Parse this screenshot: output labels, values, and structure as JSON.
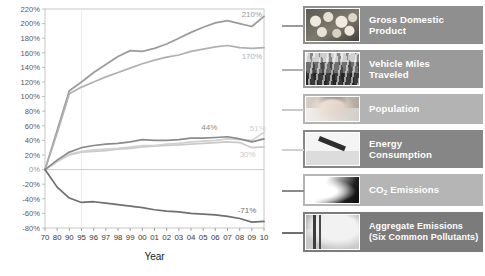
{
  "chart_data": {
    "type": "line",
    "title": "",
    "xlabel": "Year",
    "ylabel": "",
    "grid": false,
    "legend_position": "right",
    "ylim": [
      -80,
      220
    ],
    "ytick_step": 20,
    "ytick_labels": [
      "220%",
      "200%",
      "180%",
      "160%",
      "140%",
      "120%",
      "100%",
      "80%",
      "60%",
      "40%",
      "20%",
      "0%",
      "-20%",
      "-40%",
      "-60%",
      "-80%"
    ],
    "categories": [
      "70",
      "80",
      "90",
      "95",
      "96",
      "97",
      "98",
      "99",
      "00",
      "01",
      "02",
      "03",
      "04",
      "05",
      "06",
      "07",
      "08",
      "09",
      "10"
    ],
    "series": [
      {
        "name": "Gross Domestic Product",
        "color": "#9b9b9b",
        "end_label": "210%",
        "values": [
          0,
          54,
          108,
          120,
          133,
          144,
          155,
          163,
          162,
          166,
          172,
          180,
          188,
          195,
          201,
          204,
          200,
          196,
          210
        ]
      },
      {
        "name": "Vehicle Miles Traveled",
        "color": "#b0b0b0",
        "end_label": "170%",
        "values": [
          0,
          50,
          104,
          113,
          120,
          127,
          133,
          139,
          145,
          150,
          154,
          157,
          162,
          165,
          168,
          170,
          167,
          166,
          167
        ]
      },
      {
        "name": "Population",
        "color": "#c9c9c9",
        "end_label": "30%",
        "values": [
          0,
          11,
          20,
          24,
          25,
          26,
          28,
          29,
          31,
          32,
          33,
          34,
          35,
          36,
          37,
          38,
          37,
          30,
          31
        ]
      },
      {
        "name": "Energy Consumption",
        "color": "#d0d0d0",
        "end_label": "51%",
        "values": [
          0,
          11,
          21,
          25,
          27,
          28,
          29,
          31,
          33,
          33,
          35,
          36,
          38,
          39,
          40,
          42,
          41,
          40,
          51
        ]
      },
      {
        "name": "CO2 Emissions",
        "color": "#8a8a8a",
        "end_label": "44%",
        "values": [
          0,
          13,
          24,
          30,
          33,
          35,
          36,
          38,
          41,
          40,
          40,
          41,
          43,
          43,
          44,
          45,
          42,
          38,
          42
        ]
      },
      {
        "name": "Aggregate Emissions (Six Common Pollutants)",
        "color": "#6f6f6f",
        "end_label": "-71%",
        "values": [
          0,
          -24,
          -39,
          -45,
          -44,
          -46,
          -48,
          -50,
          -52,
          -55,
          -57,
          -58,
          -60,
          -61,
          -62,
          -64,
          -67,
          -72,
          -71
        ]
      }
    ]
  },
  "legend": {
    "items": [
      {
        "label_line1": "Gross Domestic",
        "label_line2": "Product",
        "thumb": "coins-photo",
        "bg": "#8f8f8f",
        "connector": "#9b9b9b"
      },
      {
        "label_line1": "Vehicle Miles",
        "label_line2": "Traveled",
        "thumb": "traffic-photo",
        "bg": "#9a9a9a",
        "connector": "#b0b0b0"
      },
      {
        "label_line1": "Population",
        "label_line2": "",
        "thumb": "baby-photo",
        "bg": "#b3b3b3",
        "connector": "#c9c9c9"
      },
      {
        "label_line1": "Energy",
        "label_line2": "Consumption",
        "thumb": "fuel-pump-photo",
        "bg": "#868686",
        "connector": "#d0d0d0"
      },
      {
        "label_line1": "CO2 Emissions",
        "label_line2": "",
        "thumb": "tailpipe-smoke-photo",
        "bg": "#b5b5b5",
        "connector": "#8a8a8a"
      },
      {
        "label_line1": "Aggregate Emissions",
        "label_line2": "(Six Common Pollutants)",
        "thumb": "smokestacks-photo",
        "bg": "#7b7b7b",
        "connector": "#6f6f6f"
      }
    ]
  }
}
